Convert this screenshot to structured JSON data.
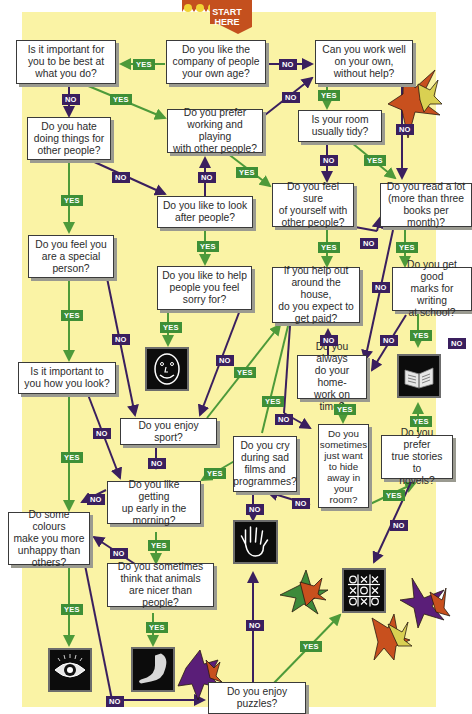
{
  "start": {
    "label": "START\nHERE"
  },
  "labels": {
    "yes": "YES",
    "no": "NO"
  },
  "colors": {
    "background": "#faf3a5",
    "yes": "#3e8f36",
    "no": "#3a1f5e",
    "start_banner": "#c4501e",
    "box_border": "#3a3a3a"
  },
  "questions": {
    "company": "Do you like the\ncompany of people\nyour own age?",
    "best": "Is it important for\nyou to be best at\nwhat you do?",
    "work_alone": "Can you work well\non your own,\nwithout help?",
    "hate_doing": "Do you hate\ndoing things for\nother people?",
    "prefer_working": "Do you prefer\nworking and playing\nwith other people?",
    "tidy": "Is your room\nusually tidy?",
    "look_after": "Do you like to look\nafter people?",
    "feel_sure": "Do you feel sure\nof yourself with\nother people?",
    "read_lot": "Do you read a lot\n(more than three\nbooks per month)?",
    "special": "Do you feel you\nare a special\nperson?",
    "help_sorry": "Do you like to help\npeople you feel\nsorry for?",
    "get_paid": "If you help out\naround the house,\ndo you expect to\nget paid?",
    "good_marks": "Do you get good\nmarks for writing\nat school?",
    "how_look": "Is it important to\nyou how you look?",
    "homework": "Do you always\ndo your home-\nwork on time?",
    "sport": "Do you enjoy sport?",
    "cry": "Do you cry\nduring sad\nfilms and\nprogrammes?",
    "hide_away": "Do you\nsometimes\njust want\nto hide\naway in\nyour\nroom?",
    "true_stories": "Do you prefer\ntrue stories to\nnovels?",
    "early": "Do you like getting\nup early in the\nmorning?",
    "colours": "Do some colours\nmake you more\nunhappy than\nothers?",
    "animals": "Do you sometimes\nthink that animals\nare nicer than people?",
    "puzzles": "Do you enjoy\npuzzles?"
  },
  "results": [
    {
      "id": "face",
      "icon": "smiley-face-icon"
    },
    {
      "id": "book",
      "icon": "open-book-icon"
    },
    {
      "id": "hand",
      "icon": "hand-icon"
    },
    {
      "id": "tictactoe",
      "icon": "tic-tac-toe-icon"
    },
    {
      "id": "eye",
      "icon": "eye-icon"
    },
    {
      "id": "arm",
      "icon": "arm-icon"
    }
  ]
}
